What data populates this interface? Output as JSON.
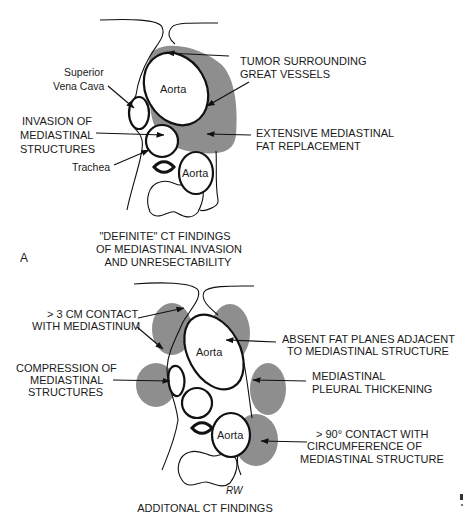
{
  "figure": {
    "panel_a": {
      "panel_letter": "A",
      "caption_lines": [
        "\"DEFINITE\" CT FINDINGS",
        "OF MEDIASTINAL INVASION",
        "AND UNRESECTABILITY"
      ],
      "structure_labels": {
        "aorta_ascending": "Aorta",
        "aorta_descending": "Aorta",
        "svc": [
          "Superior",
          "Vena Cava"
        ],
        "trachea": "Trachea"
      },
      "annotations": {
        "tumor": [
          "TUMOR SURROUNDING",
          "GREAT VESSELS"
        ],
        "invasion": [
          "INVASION OF",
          "MEDIASTINAL",
          "STRUCTURES"
        ],
        "fat_replacement": [
          "EXTENSIVE MEDIASTINAL",
          "FAT REPLACEMENT"
        ]
      }
    },
    "panel_b": {
      "caption": "ADDITONAL CT FINDINGS",
      "signature": "RW",
      "structure_labels": {
        "aorta_ascending": "Aorta",
        "aorta_descending": "Aorta"
      },
      "annotations": {
        "contact_3cm": [
          "> 3 CM CONTACT",
          "WITH MEDIASTINUM"
        ],
        "compression": [
          "COMPRESSION OF",
          "MEDIASTINAL",
          "STRUCTURES"
        ],
        "absent_fat": [
          "ABSENT FAT PLANES ADJACENT",
          "TO MEDIASTINAL STRUCTURE"
        ],
        "pleural_thickening": [
          "MEDIASTINAL",
          "PLEURAL THICKENING"
        ],
        "contact_90": [
          "> 90° CONTACT WITH",
          "CIRCUMFERENCE OF",
          "MEDIASTINAL STRUCTURE"
        ]
      }
    },
    "colors": {
      "tumor_fill": "#8e8e8e",
      "line": "#111111",
      "background": "#ffffff"
    }
  }
}
